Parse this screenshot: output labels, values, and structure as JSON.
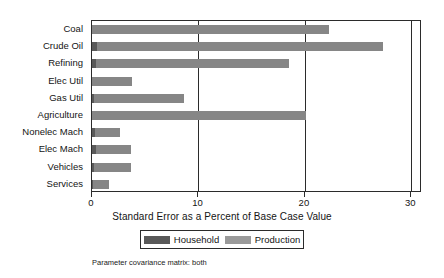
{
  "chart_data": {
    "type": "bar",
    "orientation": "horizontal",
    "title": "",
    "xlabel": "Standard Error as a Percent of Base Case Value",
    "ylabel": "",
    "xlim": [
      0,
      31.0
    ],
    "xticks": [
      0,
      10,
      20,
      30
    ],
    "xtick_labels": [
      "0",
      "10",
      "20",
      "30"
    ],
    "grid": "vertical",
    "legend_position": "bottom",
    "categories": [
      "Coal",
      "Crude Oil",
      "Refining",
      "Elec Util",
      "Gas Util",
      "Agriculture",
      "Nonelec Mach",
      "Elec Mach",
      "Vehicles",
      "Services"
    ],
    "series": [
      {
        "name": "Household",
        "color": "#595959",
        "values": [
          0.0,
          0.5,
          0.4,
          0.0,
          0.2,
          0.0,
          0.3,
          0.4,
          0.2,
          0.1
        ]
      },
      {
        "name": "Production",
        "color": "#868686",
        "values": [
          22.3,
          27.3,
          18.5,
          3.8,
          8.6,
          20.1,
          2.6,
          3.7,
          3.7,
          1.6
        ]
      }
    ],
    "annotations": [
      "Parameter covariance matrix: both"
    ]
  },
  "caption": "Parameter covariance matrix: both",
  "legend": {
    "items": [
      {
        "label": "Household",
        "swatch": "household-swatch"
      },
      {
        "label": "Production",
        "swatch": "production-swatch"
      }
    ]
  }
}
